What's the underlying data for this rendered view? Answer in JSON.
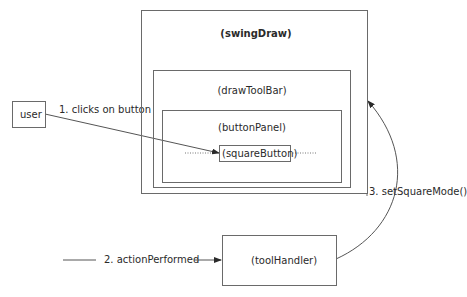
{
  "diagram": {
    "type": "sequence-collaboration",
    "nodes": {
      "user": {
        "label": "user"
      },
      "swing_draw": {
        "label": "(swingDraw)"
      },
      "draw_tool_bar": {
        "label": "(drawToolBar)"
      },
      "button_panel": {
        "label": "(buttonPanel)"
      },
      "square_button": {
        "label": "(squareButton)"
      },
      "tool_handler": {
        "label": "(toolHandler)"
      }
    },
    "messages": [
      {
        "label": "1. clicks on button",
        "from": "user",
        "to": "square_button"
      },
      {
        "label": "2. actionPerformed",
        "from": "square_button",
        "to": "tool_handler"
      },
      {
        "label": "3. setSquareMode()",
        "from": "tool_handler",
        "to": "swing_draw"
      }
    ]
  },
  "colors": {
    "line": "#6a6a6a",
    "text": "#2a2a2a",
    "background": "#ffffff"
  }
}
